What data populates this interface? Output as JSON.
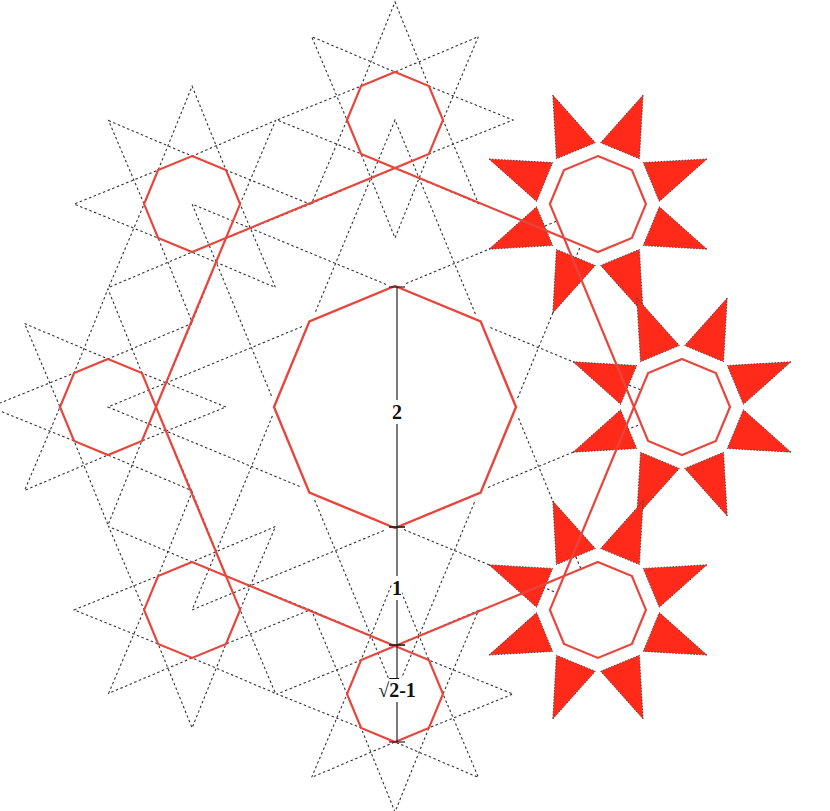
{
  "diagram": {
    "canvas": {
      "width": 830,
      "height": 811,
      "background": "#ffffff"
    },
    "colors": {
      "octagon_stroke": "#e8453c",
      "star_fill": "#ff2a1a",
      "dotted_stroke": "#333333",
      "measure_stroke": "#222222",
      "label_color": "#111111"
    },
    "center": {
      "x": 395,
      "y": 407
    },
    "central_octagon": {
      "circumradius": 121,
      "rotation_deg": 0
    },
    "ring": {
      "radius": 287,
      "count": 8,
      "start_angle_deg": -90,
      "small_octagon_circumradius": 48
    },
    "ring_nodes": [
      {
        "id": "top",
        "angle_deg": -90,
        "dotted_star": true,
        "filled_star": false
      },
      {
        "id": "upper-right",
        "angle_deg": -45,
        "dotted_star": false,
        "filled_star": true
      },
      {
        "id": "right",
        "angle_deg": 0,
        "dotted_star": false,
        "filled_star": true
      },
      {
        "id": "lower-right",
        "angle_deg": 45,
        "dotted_star": false,
        "filled_star": true
      },
      {
        "id": "bottom",
        "angle_deg": 90,
        "dotted_star": true,
        "filled_star": false
      },
      {
        "id": "lower-left",
        "angle_deg": 135,
        "dotted_star": true,
        "filled_star": false
      },
      {
        "id": "left",
        "angle_deg": 180,
        "dotted_star": true,
        "filled_star": false
      },
      {
        "id": "upper-left",
        "angle_deg": -135,
        "dotted_star": true,
        "filled_star": false
      }
    ],
    "star": {
      "outer_radius": 118,
      "inner_radius": 62,
      "points": 8
    },
    "measurements": [
      {
        "id": "measure-2",
        "label": "2",
        "from_y": 287,
        "to_y": 527,
        "label_y": 412
      },
      {
        "id": "measure-1",
        "label": "1",
        "from_y": 527,
        "to_y": 645,
        "label_y": 588
      },
      {
        "id": "measure-sqrt",
        "label_radical": "√",
        "label_radicand": "2",
        "label_suffix": "-1",
        "from_y": 645,
        "to_y": 742,
        "label_y": 690
      }
    ],
    "measure_x": 397
  }
}
